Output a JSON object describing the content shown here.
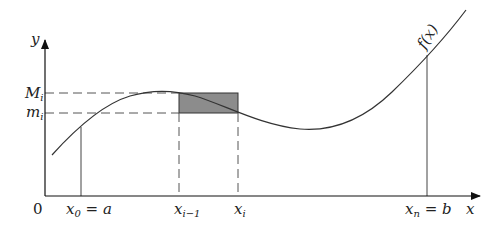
{
  "diagram": {
    "curve_label": "f(x)",
    "axes": {
      "x_label": "x",
      "y_label": "y",
      "origin_label": "0"
    },
    "x_ticks": {
      "a": {
        "main": "x",
        "sub": "0",
        "rest": " = a"
      },
      "xi_minus_1": {
        "main": "x",
        "sub": "i−1"
      },
      "xi": {
        "main": "x",
        "sub": "i"
      },
      "b": {
        "main": "x",
        "sub": "n",
        "rest": " = b"
      }
    },
    "y_ticks": {
      "upper": {
        "main": "M",
        "sub": "i"
      },
      "lower": {
        "main": "m",
        "sub": "i"
      }
    },
    "colors": {
      "line": "#333333",
      "shade": "#8c8c8c",
      "dash": "#555555"
    }
  }
}
